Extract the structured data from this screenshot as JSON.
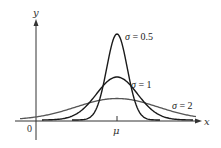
{
  "chart_data": {
    "type": "line",
    "title": "",
    "xlabel": "x",
    "ylabel": "y",
    "x_ticks": [
      {
        "label": "0",
        "position": "origin"
      },
      {
        "label": "μ",
        "position": "mean"
      }
    ],
    "grid": false,
    "legend": "inline labels next to curves",
    "mean_label": "μ",
    "series": [
      {
        "name": "σ = 0.5",
        "sigma": 0.5,
        "color": "#1a1a1a",
        "relative_peak": 0.798
      },
      {
        "name": "σ = 1",
        "sigma": 1,
        "color": "#1a1a1a",
        "relative_peak": 0.399
      },
      {
        "name": "σ = 2",
        "sigma": 2,
        "color": "#555555",
        "relative_peak": 0.199
      }
    ]
  },
  "labels": {
    "y_axis": "y",
    "x_axis": "x",
    "origin": "0",
    "mu": "μ",
    "sigma_05_sym": "σ",
    "sigma_05_text": " = 0.5",
    "sigma_1_sym": "σ",
    "sigma_1_text": " = 1",
    "sigma_2_sym": "σ",
    "sigma_2_text": " = 2"
  },
  "colors": {
    "axis": "#333333",
    "curve_dark": "#1a1a1a",
    "curve_light": "#555555",
    "background": "#ffffff"
  }
}
